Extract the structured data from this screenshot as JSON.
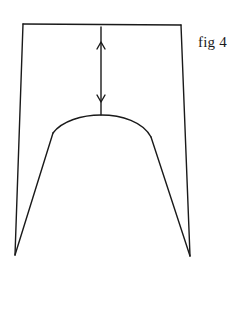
{
  "figure": {
    "label": "fig 4",
    "stroke_color": "#1a1a1a",
    "background": "#ffffff",
    "frame": {
      "top_left": [
        23,
        24
      ],
      "top_right": [
        181,
        25
      ],
      "bottom_left": [
        15,
        255
      ],
      "bottom_right": [
        190,
        256
      ]
    },
    "arch": {
      "left_end": [
        53,
        133
      ],
      "apex": [
        101,
        115
      ],
      "right_end": [
        151,
        137
      ]
    },
    "dimension_arrow": {
      "x": 101,
      "y_top": 27,
      "y_bottom": 115,
      "up_head_y": 43,
      "down_head_y": 100
    }
  }
}
